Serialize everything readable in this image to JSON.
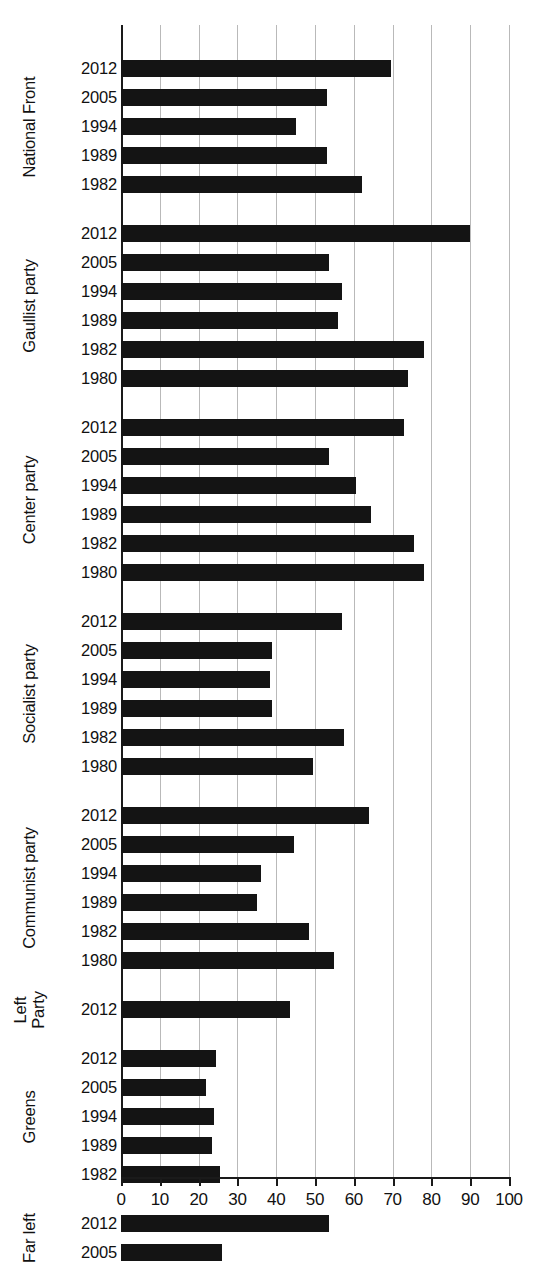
{
  "chart_data": {
    "type": "bar",
    "orientation": "horizontal",
    "title": "",
    "subtitle": "",
    "xlabel": "",
    "ylabel": "",
    "xlim": [
      0,
      100
    ],
    "xticks": [
      0,
      10,
      20,
      30,
      40,
      50,
      60,
      70,
      80,
      90,
      100
    ],
    "xtick_labels": [
      "0",
      "10",
      "20",
      "30",
      "40",
      "50",
      "60",
      "70",
      "80",
      "90",
      "100"
    ],
    "grid": "vertical",
    "legend": "none",
    "bar_color": "#141414",
    "grid_color": "#b9b9b9",
    "axis_color": "#1a1a1a",
    "groups": [
      {
        "label": "National Front",
        "label_lines": [
          "National Front"
        ],
        "categories": [
          "2012",
          "2005",
          "1994",
          "1989",
          "1982"
        ],
        "values": [
          69.5,
          53,
          45,
          53,
          62
        ]
      },
      {
        "label": "Gaullist party",
        "label_lines": [
          "Gaullist party"
        ],
        "categories": [
          "2012",
          "2005",
          "1994",
          "1989",
          "1982",
          "1980"
        ],
        "values": [
          90,
          53.5,
          57,
          56,
          78,
          74
        ]
      },
      {
        "label": "Center party",
        "label_lines": [
          "Center party"
        ],
        "categories": [
          "2012",
          "2005",
          "1994",
          "1989",
          "1982",
          "1980"
        ],
        "values": [
          73,
          53.5,
          60.5,
          64.5,
          75.5,
          78
        ]
      },
      {
        "label": "Socialist party",
        "label_lines": [
          "Socialist party"
        ],
        "categories": [
          "2012",
          "2005",
          "1994",
          "1989",
          "1982",
          "1980"
        ],
        "values": [
          57,
          39,
          38.5,
          39,
          57.5,
          49.5
        ]
      },
      {
        "label": "Communist party",
        "label_lines": [
          "Communist party"
        ],
        "categories": [
          "2012",
          "2005",
          "1994",
          "1989",
          "1982",
          "1980"
        ],
        "values": [
          64,
          44.5,
          36,
          35,
          48.5,
          55
        ]
      },
      {
        "label": "Left Party",
        "label_lines": [
          "Left",
          "Party"
        ],
        "categories": [
          "2012"
        ],
        "values": [
          43.5
        ]
      },
      {
        "label": "Greens",
        "label_lines": [
          "Greens"
        ],
        "categories": [
          "2012",
          "2005",
          "1994",
          "1989",
          "1982"
        ],
        "values": [
          24.5,
          22,
          24,
          23.5,
          25.5
        ]
      },
      {
        "label": "Far left",
        "label_lines": [
          "Far left"
        ],
        "categories": [
          "2012",
          "2005"
        ],
        "values": [
          53.5,
          26
        ]
      }
    ]
  }
}
